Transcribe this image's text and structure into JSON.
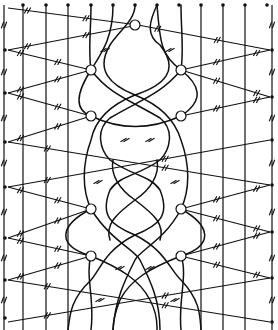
{
  "diagram": {
    "kind": "lace-pattern",
    "colors": {
      "ink": "#111111",
      "paper": "#ffffff"
    },
    "top_pins_x": [
      23,
      46,
      68,
      91,
      113,
      135,
      157,
      179,
      201,
      223,
      245,
      267
    ],
    "left_edge_pins_y": [
      50,
      93,
      142,
      187,
      238,
      280,
      318
    ],
    "right_edge_pins_y": [
      50,
      97,
      140,
      185,
      232,
      278,
      322
    ],
    "ring_pins": [
      {
        "x": 135,
        "y": 25
      },
      {
        "x": 91,
        "y": 70
      },
      {
        "x": 181,
        "y": 70
      },
      {
        "x": 91,
        "y": 116
      },
      {
        "x": 181,
        "y": 116
      },
      {
        "x": 91,
        "y": 209
      },
      {
        "x": 181,
        "y": 209
      },
      {
        "x": 91,
        "y": 256
      },
      {
        "x": 181,
        "y": 256
      }
    ],
    "vertical_passive_threads_x": [
      4,
      23,
      46,
      68,
      201,
      223,
      245,
      272
    ],
    "legend": {
      "tick_mark": "twist (double hash)",
      "dot": "pin",
      "circle": "pin with enclosed stitch"
    }
  }
}
